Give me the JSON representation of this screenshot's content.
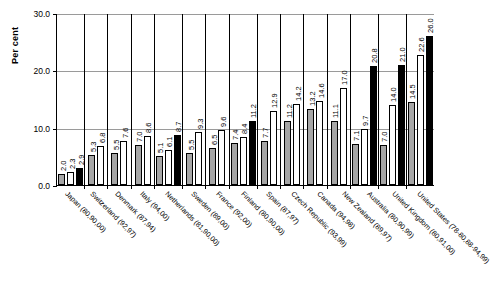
{
  "chart_data": {
    "type": "bar",
    "title": "",
    "xlabel": "",
    "ylabel": "Per cent",
    "ylim": [
      0,
      30
    ],
    "yticks": [
      "0.0",
      "10.0",
      "20.0",
      "30.0"
    ],
    "grid": true,
    "legend": "none",
    "categories": [
      "Japan (80,90,00)",
      "Switzerland (92,97)",
      "Denmark (87,94)",
      "Italy (94,00)",
      "Netherlands (81,90,00)",
      "Sweden (89,00)",
      "France (92,00)",
      "Finland (80,90,00)",
      "Spain (87,97)",
      "Czech Republic (93,99)",
      "Canada (94,98)",
      "New Zealand (89,97)",
      "Australia (80,90,99)",
      "United Kingdom (80,91,00)",
      "United States (78-80,88-94,99)"
    ],
    "series": [
      {
        "name": "period-1",
        "color": "#a6a6a6",
        "values": [
          2.0,
          null,
          5.3,
          5.5,
          7.0,
          null,
          5.5,
          6.5,
          7.4,
          7.7,
          11.2,
          13.2,
          7.1,
          7.0,
          14.5
        ]
      },
      {
        "name": "period-2",
        "color": "#ffffff",
        "values": [
          2.3,
          5.3,
          6.8,
          7.6,
          8.6,
          6.1,
          9.3,
          9.6,
          8.4,
          12.9,
          14.2,
          14.6,
          9.7,
          14.0,
          22.6
        ]
      },
      {
        "name": "period-3",
        "color": "#000000",
        "values": [
          2.9,
          null,
          null,
          null,
          null,
          8.7,
          null,
          null,
          11.2,
          null,
          17.0,
          11.1,
          20.8,
          21.0,
          26.0
        ]
      }
    ],
    "groups": [
      {
        "category": "Japan (80,90,00)",
        "bars": [
          {
            "series": 0,
            "value": 2.0,
            "label": "2.0"
          },
          {
            "series": 1,
            "value": 2.3,
            "label": "2.3"
          },
          {
            "series": 2,
            "value": 2.9,
            "label": "2.9"
          }
        ]
      },
      {
        "category": "Switzerland (92,97)",
        "bars": [
          {
            "series": 0,
            "value": 5.3,
            "label": "5.3"
          },
          {
            "series": 1,
            "value": 6.8,
            "label": "6.8"
          }
        ]
      },
      {
        "category": "Denmark (87,94)",
        "bars": [
          {
            "series": 0,
            "value": 5.5,
            "label": "5.5"
          },
          {
            "series": 1,
            "value": 7.6,
            "label": "7.6"
          }
        ]
      },
      {
        "category": "Italy (94,00)",
        "bars": [
          {
            "series": 0,
            "value": 7.0,
            "label": "7.0"
          },
          {
            "series": 1,
            "value": 8.6,
            "label": "8.6"
          }
        ]
      },
      {
        "category": "Netherlands (81,90,00)",
        "bars": [
          {
            "series": 0,
            "value": 5.1,
            "label": "5.1"
          },
          {
            "series": 1,
            "value": 6.1,
            "label": "6.1"
          },
          {
            "series": 2,
            "value": 8.7,
            "label": "8.7"
          }
        ]
      },
      {
        "category": "Sweden (89,00)",
        "bars": [
          {
            "series": 0,
            "value": 5.5,
            "label": "5.5"
          },
          {
            "series": 1,
            "value": 9.3,
            "label": "9.3"
          }
        ]
      },
      {
        "category": "France (92,00)",
        "bars": [
          {
            "series": 0,
            "value": 6.5,
            "label": "6.5"
          },
          {
            "series": 1,
            "value": 9.6,
            "label": "9.6"
          }
        ]
      },
      {
        "category": "Finland (80,90,00)",
        "bars": [
          {
            "series": 0,
            "value": 7.4,
            "label": "7.4"
          },
          {
            "series": 1,
            "value": 8.4,
            "label": "8.4"
          },
          {
            "series": 2,
            "value": 11.2,
            "label": "11.2"
          }
        ]
      },
      {
        "category": "Spain (87,97)",
        "bars": [
          {
            "series": 0,
            "value": 7.7,
            "label": "7.7"
          },
          {
            "series": 1,
            "value": 12.9,
            "label": "12.9"
          }
        ]
      },
      {
        "category": "Czech Republic (93,99)",
        "bars": [
          {
            "series": 0,
            "value": 11.2,
            "label": "11.2"
          },
          {
            "series": 1,
            "value": 14.2,
            "label": "14.2"
          }
        ]
      },
      {
        "category": "Canada (94,98)",
        "bars": [
          {
            "series": 0,
            "value": 13.2,
            "label": "13.2"
          },
          {
            "series": 1,
            "value": 14.6,
            "label": "14.6"
          }
        ]
      },
      {
        "category": "New Zealand (89,97)",
        "bars": [
          {
            "series": 0,
            "value": 11.1,
            "label": "11.1"
          },
          {
            "series": 1,
            "value": 17.0,
            "label": "17.0"
          }
        ]
      },
      {
        "category": "Australia (80,90,99)",
        "bars": [
          {
            "series": 0,
            "value": 7.1,
            "label": "7.1"
          },
          {
            "series": 1,
            "value": 9.7,
            "label": "9.7"
          },
          {
            "series": 2,
            "value": 20.8,
            "label": "20.8"
          }
        ]
      },
      {
        "category": "United Kingdom (80,91,00)",
        "bars": [
          {
            "series": 0,
            "value": 7.0,
            "label": "7.0"
          },
          {
            "series": 1,
            "value": 14.0,
            "label": "14.0"
          },
          {
            "series": 2,
            "value": 21.0,
            "label": "21.0"
          }
        ]
      },
      {
        "category": "United States (78-80,88-94,99)",
        "bars": [
          {
            "series": 0,
            "value": 14.5,
            "label": "14.5"
          },
          {
            "series": 1,
            "value": 22.6,
            "label": "22.6"
          },
          {
            "series": 2,
            "value": 26.0,
            "label": "26.0"
          }
        ]
      }
    ]
  }
}
